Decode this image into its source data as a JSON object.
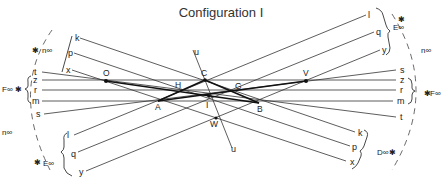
{
  "title": "Configuration I",
  "left_labels": {
    "k": "k",
    "p": "p",
    "x": "x",
    "t": "t",
    "z": "z",
    "r": "r",
    "m": "m",
    "s": "s",
    "l": "l",
    "q": "q",
    "y": "y"
  },
  "right_labels": {
    "l": "l",
    "q": "q",
    "y": "y",
    "s": "s",
    "z": "z",
    "r": "r",
    "m": "m",
    "t": "t",
    "k": "k",
    "p": "p",
    "x": "x"
  },
  "line_u": {
    "top": "u",
    "bottom": "u"
  },
  "points": {
    "O": "O",
    "H": "H",
    "C": "C",
    "G": "G",
    "V": "V",
    "A": "A",
    "I": "I",
    "B": "B",
    "W": "W"
  },
  "infinity_points": {
    "n_top_left": "n∞",
    "F_left": "F∞",
    "n_left": "n∞",
    "E_bottom_left": "E∞",
    "E_top_right": "E∞",
    "n_right": "n∞",
    "F_right": "F∞",
    "D_bottom_right": "D∞"
  },
  "star_glyph": "✱"
}
